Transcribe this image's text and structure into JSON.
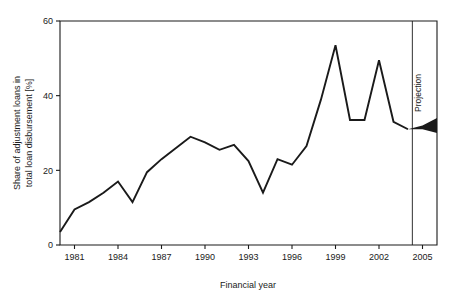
{
  "chart_data": {
    "type": "line",
    "title": "",
    "xlabel": "Financial year",
    "ylabel": "Share of adjustment loans in total loan disbursement [%]",
    "ylabel_line1": "Share of adjustment loans in",
    "ylabel_line2": "total loan disbursement [%]",
    "xlim": [
      1980,
      2006
    ],
    "ylim": [
      0,
      60
    ],
    "grid": false,
    "legend": null,
    "y_ticks": [
      0,
      20,
      40,
      60
    ],
    "y_tick_labels": [
      "0",
      "20",
      "40",
      "60"
    ],
    "x_ticks": [
      1981,
      1984,
      1987,
      1990,
      1993,
      1996,
      1999,
      2002,
      2005
    ],
    "x_tick_labels": [
      "1981",
      "1984",
      "1987",
      "1990",
      "1993",
      "1996",
      "1999",
      "2002",
      "2005"
    ],
    "x": [
      1980,
      1981,
      1982,
      1983,
      1984,
      1985,
      1986,
      1987,
      1988,
      1989,
      1990,
      1991,
      1992,
      1993,
      1994,
      1995,
      1996,
      1997,
      1998,
      1999,
      2000,
      2001,
      2002,
      2003,
      2004
    ],
    "values": [
      3.5,
      9.5,
      11.5,
      14.0,
      17.0,
      11.5,
      19.5,
      23.0,
      26.0,
      29.0,
      27.5,
      25.5,
      26.8,
      22.5,
      14.0,
      23.0,
      21.5,
      26.5,
      39.0,
      53.5,
      33.5,
      33.5,
      49.5,
      33.0,
      31.0
    ],
    "series": [
      {
        "name": "Share of adjustment loans in total loan disbursement",
        "values": [
          3.5,
          9.5,
          11.5,
          14.0,
          17.0,
          11.5,
          19.5,
          23.0,
          26.0,
          29.0,
          27.5,
          25.5,
          26.8,
          22.5,
          14.0,
          23.0,
          21.5,
          26.5,
          39.0,
          53.5,
          33.5,
          33.5,
          49.5,
          33.0,
          31.0
        ]
      }
    ],
    "annotations": [
      {
        "name": "projection-divider",
        "label": "Projection",
        "x": 2004.3,
        "orientation": "vertical"
      }
    ],
    "projection": {
      "label": "Projection",
      "start_year": 2004,
      "end_year": 2006,
      "x": [
        2004,
        2005,
        2006
      ],
      "upper": [
        31.0,
        32.0,
        34.0
      ],
      "lower": [
        31.0,
        31.0,
        30.0
      ]
    },
    "colors": {
      "line": "#1a1a1a",
      "axis": "#1a1a1a",
      "band": "#1a1a1a",
      "background": "#ffffff"
    }
  }
}
